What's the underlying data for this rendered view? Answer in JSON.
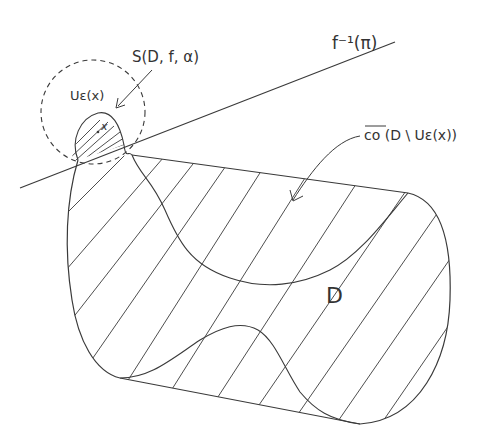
{
  "diagram": {
    "stroke_color": "#3a3a3a",
    "background": "#ffffff",
    "labels": {
      "preimage_line": "f⁻¹(π)",
      "neighborhood": "Uε(x)",
      "slice": "S(D, f, α)",
      "convex_hull": "co (D \\ Uε(x))",
      "domain": "D",
      "point": "x"
    }
  }
}
